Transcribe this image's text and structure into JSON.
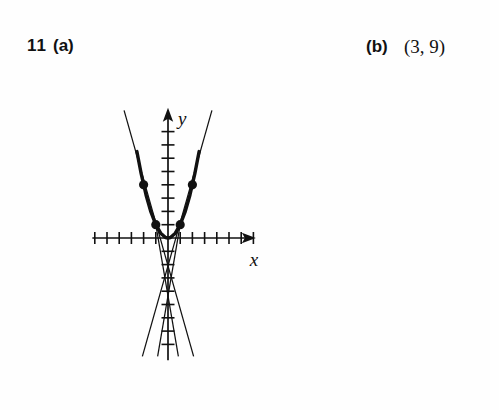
{
  "answer": {
    "question_number": "11",
    "part_a_label": "(a)",
    "part_b_label": "(b)",
    "part_b_value": "(3, 9)"
  },
  "figure": {
    "x_axis_label": "x",
    "y_axis_label": "y"
  },
  "chart_data": {
    "type": "line",
    "title": "",
    "subtitle": "",
    "xlabel": "x",
    "ylabel": "y",
    "xlim": [
      -6.2,
      7.2
    ],
    "ylim": [
      -9.2,
      9.8
    ],
    "grid": false,
    "legend": null,
    "axes": {
      "x_tick_values": [
        -6,
        -5,
        -4,
        -3,
        -2,
        -1,
        1,
        2,
        3,
        4,
        5,
        6,
        7
      ],
      "y_tick_values": [
        -8,
        -7,
        -6,
        -5,
        -4,
        -3,
        -2,
        -1,
        1,
        2,
        3,
        4,
        5,
        6,
        7,
        8
      ],
      "tick_labels_shown": false,
      "x_arrow": "positive",
      "y_arrow": "positive",
      "origin": [
        0,
        0
      ]
    },
    "series": [
      {
        "name": "parabola",
        "type": "curve",
        "equation": "y = x^2",
        "style": "thick",
        "x": [
          -2.55,
          -2.2,
          -1.8,
          -1.4,
          -1.0,
          -0.6,
          -0.2,
          0,
          0.2,
          0.6,
          1.0,
          1.4,
          1.8,
          2.2,
          2.55
        ],
        "y": [
          6.5,
          4.84,
          3.24,
          1.96,
          1.0,
          0.36,
          0.04,
          0,
          0.04,
          0.36,
          1.0,
          1.96,
          3.24,
          4.84,
          6.5
        ]
      },
      {
        "name": "secant-left-outer",
        "type": "line",
        "style": "thin",
        "points": [
          [
            -3.6,
            9.6
          ],
          [
            2.1,
            -8.9
          ]
        ]
      },
      {
        "name": "secant-right-outer",
        "type": "line",
        "style": "thin",
        "points": [
          [
            3.6,
            9.6
          ],
          [
            -2.1,
            -8.9
          ]
        ]
      },
      {
        "name": "secant-left-inner",
        "type": "line",
        "style": "thin",
        "points": [
          [
            -1.0,
            1.0
          ],
          [
            0.85,
            -8.9
          ]
        ]
      },
      {
        "name": "secant-right-inner",
        "type": "line",
        "style": "thin",
        "points": [
          [
            1.0,
            1.0
          ],
          [
            -0.85,
            -8.9
          ]
        ]
      }
    ],
    "points": [
      {
        "label": "",
        "x": -2,
        "y": 4,
        "marker": "filled-circle"
      },
      {
        "label": "",
        "x": 2,
        "y": 4,
        "marker": "filled-circle"
      },
      {
        "label": "",
        "x": -1,
        "y": 1,
        "marker": "filled-circle"
      },
      {
        "label": "",
        "x": 1,
        "y": 1,
        "marker": "filled-circle"
      }
    ],
    "annotations": []
  },
  "style": {
    "ink": "#111111",
    "background": "#ffffff"
  }
}
